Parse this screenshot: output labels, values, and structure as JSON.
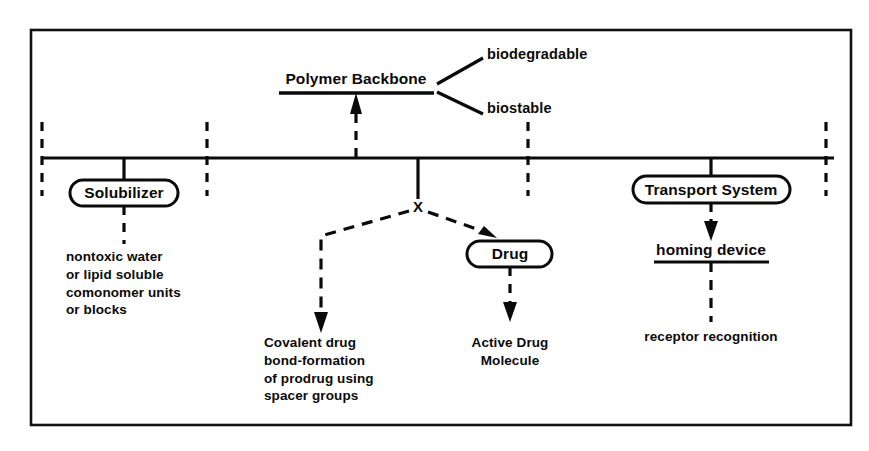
{
  "figure": {
    "border_color": "#111111",
    "line_color": "#0a0a0a",
    "background": "#ffffff"
  },
  "nodes": {
    "polymer_backbone": "Polymer Backbone",
    "solubilizer": "Solubilizer",
    "transport_system": "Transport System",
    "drug": "Drug",
    "homing_device": "homing device",
    "junction_marker": "X"
  },
  "branches": {
    "biodegradable": "biodegradable",
    "biostable": "biostable"
  },
  "descriptions": {
    "solubilizer_detail": "nontoxic water\nor lipid soluble\ncomonomer units\nor blocks",
    "prodrug_detail": "Covalent drug\nbond-formation\nof prodrug using\nspacer groups",
    "drug_detail": "Active Drug\nMolecule",
    "transport_detail": "receptor recognition"
  }
}
